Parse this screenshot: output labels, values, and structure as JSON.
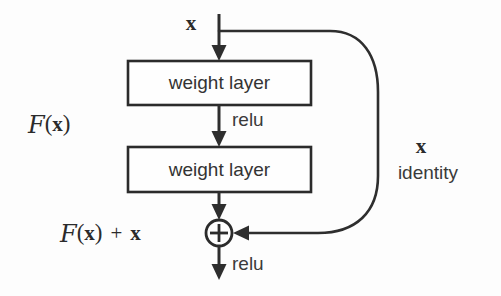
{
  "figure": {
    "background_color": "#fdfdfd",
    "stroke_color": "#2e2e2e",
    "text_color": "#333333"
  },
  "nodes": {
    "input_label": "x",
    "layer1_label": "weight layer",
    "layer2_label": "weight layer",
    "relu_mid_label": "relu",
    "relu_out_label": "relu",
    "sum_symbol": "+"
  },
  "annotations": {
    "residual_function": {
      "script_f": "F",
      "open_paren": "(",
      "variable": "x",
      "close_paren": ")"
    },
    "output_function": {
      "script_f": "F",
      "open_paren": "(",
      "variable": "x",
      "close_paren": ")",
      "operator": "+",
      "addend": "x"
    },
    "shortcut_variable": "x",
    "shortcut_label": "identity"
  }
}
